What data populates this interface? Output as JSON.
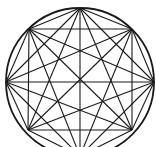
{
  "diagram": {
    "type": "complete-graph-inscribed-in-circle",
    "circle": {
      "cx": 80,
      "cy": 82,
      "r": 74,
      "stroke": "#1a1a1a",
      "stroke_width": 1.8
    },
    "vertex_count": 8,
    "vertices": [
      {
        "x": 80,
        "y": 8
      },
      {
        "x": 132,
        "y": 29
      },
      {
        "x": 154,
        "y": 82
      },
      {
        "x": 132,
        "y": 130
      },
      {
        "x": 80,
        "y": 156
      },
      {
        "x": 28,
        "y": 130
      },
      {
        "x": 6,
        "y": 82
      },
      {
        "x": 29,
        "y": 29
      }
    ],
    "edges": "all-pairs",
    "line_color": "#1a1a1a",
    "line_width": 1.1,
    "background": "#ffffff"
  }
}
